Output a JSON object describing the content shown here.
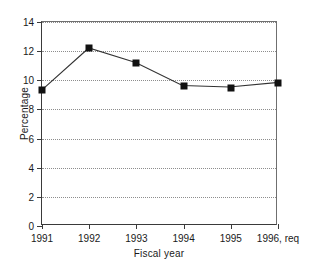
{
  "chart_data": {
    "type": "line",
    "title": "",
    "xlabel": "Fiscal year",
    "ylabel": "Percentage",
    "categories": [
      "1991",
      "1992",
      "1993",
      "1994",
      "1995",
      "1996, req"
    ],
    "values": [
      9.3,
      12.2,
      11.2,
      9.6,
      9.5,
      9.8
    ],
    "series": [
      {
        "name": "Percentage",
        "values": [
          9.3,
          12.2,
          11.2,
          9.6,
          9.5,
          9.8
        ]
      }
    ],
    "ylim": [
      0,
      14
    ],
    "y_ticks": [
      0,
      2,
      4,
      6,
      8,
      10,
      12,
      14
    ],
    "y_tick_labels": [
      "0",
      "2",
      "4",
      "6",
      "8",
      "10",
      "12",
      "14"
    ],
    "x_tick_labels": [
      "1991",
      "1992",
      "1993",
      "1994",
      "1995",
      "1996, req"
    ],
    "grid": "horizontal-dotted",
    "legend": "none",
    "marker": "square",
    "line_color": "#333333",
    "marker_color": "#111111"
  }
}
